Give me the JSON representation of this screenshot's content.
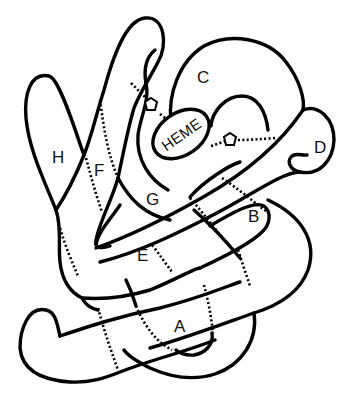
{
  "diagram": {
    "helix_labels": {
      "A": "A",
      "B": "B",
      "C": "C",
      "D": "D",
      "E": "E",
      "F": "F",
      "G": "G",
      "H": "H"
    },
    "heme_label": "HEME",
    "histidine_markers": [
      "proximal-histidine (F helix)",
      "distal-histidine (E helix)"
    ],
    "colors": {
      "line": "#000000",
      "background": "#ffffff",
      "text": "#111111"
    }
  }
}
